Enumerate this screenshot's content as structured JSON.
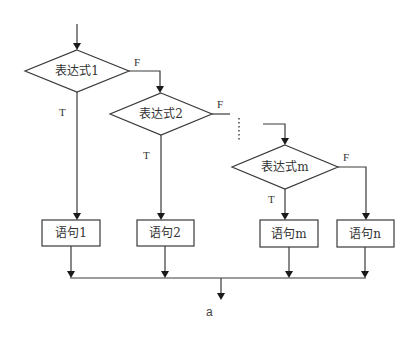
{
  "diagram": {
    "type": "flowchart",
    "title": "",
    "decisions": [
      {
        "id": "d1",
        "label": "表达式1",
        "true_label": "T",
        "false_label": "F"
      },
      {
        "id": "d2",
        "label": "表达式2",
        "true_label": "T",
        "false_label": "F"
      },
      {
        "id": "dm",
        "label": "表达式m",
        "true_label": "T",
        "false_label": "F"
      }
    ],
    "statements": [
      {
        "id": "s1",
        "label": "语句1"
      },
      {
        "id": "s2",
        "label": "语句2"
      },
      {
        "id": "sm",
        "label": "语句m"
      },
      {
        "id": "sn",
        "label": "语句n"
      }
    ],
    "edges": [
      {
        "from": "start",
        "to": "d1"
      },
      {
        "from": "d1",
        "to": "s1",
        "label": "T"
      },
      {
        "from": "d1",
        "to": "d2",
        "label": "F"
      },
      {
        "from": "d2",
        "to": "s2",
        "label": "T"
      },
      {
        "from": "d2",
        "to": "...",
        "label": "F"
      },
      {
        "from": "...",
        "to": "dm"
      },
      {
        "from": "dm",
        "to": "sm",
        "label": "T"
      },
      {
        "from": "dm",
        "to": "sn",
        "label": "F"
      },
      {
        "from": "s1",
        "to": "merge"
      },
      {
        "from": "s2",
        "to": "merge"
      },
      {
        "from": "sm",
        "to": "merge"
      },
      {
        "from": "sn",
        "to": "merge"
      },
      {
        "from": "merge",
        "to": "exit"
      }
    ],
    "exit_label": "a",
    "colors": {
      "line": "#3a3a3a",
      "text": "#333333",
      "background": "#ffffff"
    }
  }
}
